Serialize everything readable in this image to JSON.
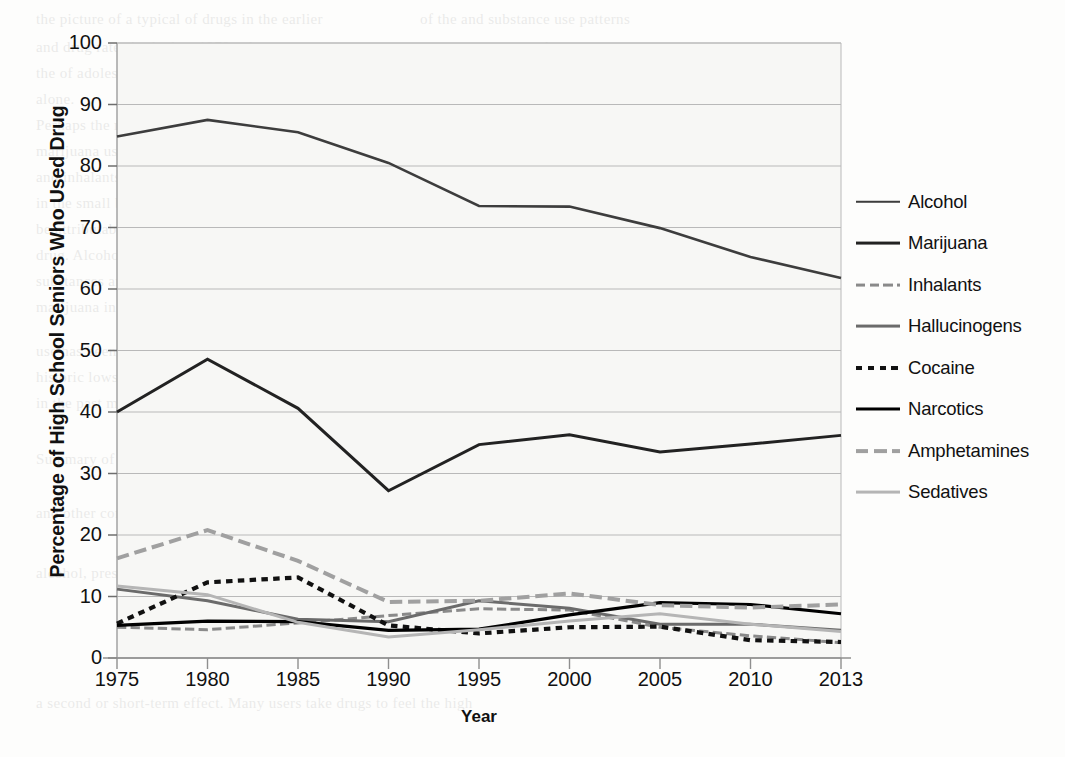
{
  "chart_data": {
    "type": "line",
    "title": "",
    "xlabel": "Year",
    "ylabel": "Percentage of High School Seniors Who Used Drug",
    "x": [
      1975,
      1980,
      1985,
      1990,
      1995,
      2000,
      2005,
      2010,
      2013
    ],
    "xticklabels": [
      "1975",
      "1980",
      "1985",
      "1990",
      "1995",
      "2000",
      "2005",
      "2010",
      "2013"
    ],
    "yticklabels": [
      "0",
      "10",
      "20",
      "30",
      "40",
      "50",
      "60",
      "70",
      "80",
      "90",
      "100"
    ],
    "ylim": [
      0,
      100
    ],
    "ytick_step": 10,
    "grid": "horizontal",
    "legend_position": "right",
    "series": [
      {
        "name": "Alcohol",
        "values": [
          84.8,
          87.5,
          85.5,
          80.5,
          73.5,
          73.4,
          69.9,
          65.2,
          61.8
        ],
        "color": "#3d3d3d",
        "style": "solid",
        "width": 2.6
      },
      {
        "name": "Marijuana",
        "values": [
          40.0,
          48.6,
          40.6,
          27.2,
          34.7,
          36.3,
          33.5,
          34.8,
          36.2
        ],
        "color": "#222222",
        "style": "solid",
        "width": 3.0
      },
      {
        "name": "Inhalants",
        "values": [
          5.0,
          4.6,
          5.7,
          6.9,
          8.0,
          7.8,
          5.0,
          3.6,
          2.5
        ],
        "color": "#8a8a8a",
        "style": "dashed",
        "width": 3.0
      },
      {
        "name": "Hallucinogens",
        "values": [
          11.2,
          9.3,
          6.3,
          5.9,
          9.3,
          8.1,
          5.5,
          5.5,
          4.5
        ],
        "color": "#6b6b6b",
        "style": "solid",
        "width": 3.0
      },
      {
        "name": "Cocaine",
        "values": [
          5.6,
          12.3,
          13.1,
          5.3,
          4.0,
          5.0,
          5.1,
          2.9,
          2.6
        ],
        "color": "#111111",
        "style": "dotted",
        "width": 4.2
      },
      {
        "name": "Narcotics",
        "values": [
          5.3,
          6.0,
          5.9,
          4.5,
          4.7,
          7.0,
          9.0,
          8.7,
          7.2
        ],
        "color": "#000000",
        "style": "solid",
        "width": 3.2
      },
      {
        "name": "Amphetamines",
        "values": [
          16.2,
          20.8,
          15.8,
          9.1,
          9.3,
          10.5,
          8.6,
          8.2,
          8.7
        ],
        "color": "#a0a0a0",
        "style": "dashed",
        "width": 4.0
      },
      {
        "name": "Sedatives",
        "values": [
          11.7,
          10.3,
          5.8,
          3.4,
          4.6,
          6.0,
          7.2,
          5.5,
          4.3
        ],
        "color": "#b5b5b5",
        "style": "solid",
        "width": 3.0
      }
    ]
  },
  "plot": {
    "left": 117,
    "right": 841,
    "top": 43,
    "bottom": 658,
    "axis_color": "#a8a8a8",
    "grid_color": "#b9b9b9",
    "background": "#f7f7f5"
  },
  "background_text": [
    {
      "x": 36,
      "y": 6,
      "t": "the picture  of a  typical  of drugs  in  the  earlier"
    },
    {
      "x": 420,
      "y": 6,
      "t": "of the  and  substance  use  patterns"
    },
    {
      "x": 36,
      "y": 34,
      "t": "and  drug  rates  in  the  late  1970s,  the"
    },
    {
      "x": 430,
      "y": 34,
      "t": "an  survey  reported"
    },
    {
      "x": 36,
      "y": 60,
      "t": "the  of  adolescents  and  young  adults  in  a  year  on  drug  use"
    },
    {
      "x": 36,
      "y": 86,
      "t": "alone."
    },
    {
      "x": 36,
      "y": 112,
      "t": "Perhaps  the  most  dramatic  change  shown  in  the  figure  is  the  decline  in"
    },
    {
      "x": 36,
      "y": 138,
      "t": "marijuana  use"
    },
    {
      "x": 36,
      "y": 164,
      "t": "and  inhalants  the  1980s  and  the  decline  in  cocaine  use  that  are  shown"
    },
    {
      "x": 36,
      "y": 190,
      "t": "in  the  small  but  steady  increase  in  narcotics  that  have  been  reported"
    },
    {
      "x": 36,
      "y": 216,
      "t": "be  attributable  in  change  in  the  way  questions  were  asked"
    },
    {
      "x": 36,
      "y": 242,
      "t": "drug.  Alcohol  and  marijuana  remain  the  most  commonly  used  illicit"
    },
    {
      "x": 36,
      "y": 268,
      "t": "substances  among  seniors,  and  about  36%  of  seniors  reported  using"
    },
    {
      "x": 36,
      "y": 294,
      "t": "marijuana  in  the  past  year  (Johnston,  et  al.,  2014)."
    },
    {
      "x": 36,
      "y": 338,
      "t": "use  has  been  and  the  rates  of  smoking  among  teens  are  now  at"
    },
    {
      "x": 36,
      "y": 364,
      "t": "historic  lows.  While  in  1975  about  36%  of  seniors  had  smoked  a  cigarette"
    },
    {
      "x": 36,
      "y": 390,
      "t": "in  the  past  month,  by  2013  that  had  declined  to  about  16%."
    },
    {
      "x": 36,
      "y": 446,
      "t": "Summary  of  Drug  Use  Patterns"
    },
    {
      "x": 36,
      "y": 500,
      "t": "and  other  conditions  that"
    },
    {
      "x": 36,
      "y": 560,
      "t": "alcohol,  prescription  medications,  and  illicit  drugs"
    },
    {
      "x": 36,
      "y": 690,
      "t": "a  second  or  short-term  effect.  Many  users  take  drugs  to  feel  the  high"
    }
  ]
}
